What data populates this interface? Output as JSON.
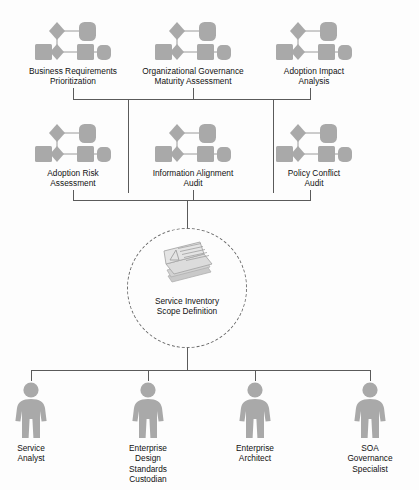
{
  "diagram": {
    "colors": {
      "shape_fill": "#a9a9a9",
      "shape_stroke": "#8f8f8f",
      "connector": "#5a5a5a",
      "background": "#fdfdfd",
      "text": "#111111"
    },
    "top_row": [
      {
        "id": "business-requirements-prioritization",
        "label": "Business Requirements\nPrioritization",
        "icon": "process-icon"
      },
      {
        "id": "organizational-governance-maturity-assessment",
        "label": "Organizational Governance\nMaturity Assessment",
        "icon": "process-icon"
      },
      {
        "id": "adoption-impact-analysis",
        "label": "Adoption Impact\nAnalysis",
        "icon": "process-icon"
      }
    ],
    "middle_row": [
      {
        "id": "adoption-risk-assessment",
        "label": "Adoption Risk\nAssessment",
        "icon": "process-icon"
      },
      {
        "id": "information-alignment-audit",
        "label": "Information Alignment\nAudit",
        "icon": "process-icon"
      },
      {
        "id": "policy-conflict-audit",
        "label": "Policy Conflict\nAudit",
        "icon": "process-icon"
      }
    ],
    "center": {
      "id": "service-inventory-scope-definition",
      "label": "Service Inventory\nScope Definition",
      "icon": "document-stack-icon",
      "shape": "dashed-circle"
    },
    "roles": [
      {
        "id": "service-analyst",
        "label": "Service\nAnalyst",
        "icon": "person-icon"
      },
      {
        "id": "enterprise-design-standards-custodian",
        "label": "Enterprise\nDesign\nStandards\nCustodian",
        "icon": "person-icon"
      },
      {
        "id": "enterprise-architect",
        "label": "Enterprise\nArchitect",
        "icon": "person-icon"
      },
      {
        "id": "soa-governance-specialist",
        "label": "SOA\nGovernance\nSpecialist",
        "icon": "person-icon"
      }
    ]
  }
}
